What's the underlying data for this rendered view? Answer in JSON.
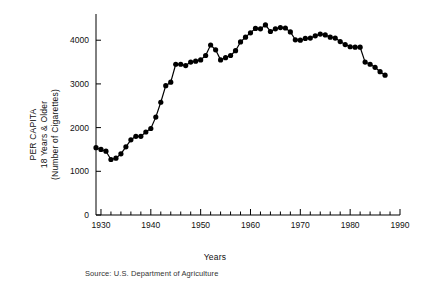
{
  "chart_data": {
    "type": "line",
    "title": "",
    "subtitle": "",
    "xlabel": "Years",
    "ylabel": "PER CAPITA 18 Years & Older (Number of Cigarettes)",
    "ylabel_lines": [
      "PER CAPITA",
      "18 Years & Older",
      "(Number of Cigarettes)"
    ],
    "source_note": "Source: U.S. Department of Agriculture",
    "xlim": [
      1929,
      1990
    ],
    "ylim": [
      0,
      4600
    ],
    "xticks_major": [
      1930,
      1940,
      1950,
      1960,
      1970,
      1980,
      1990
    ],
    "xtick_labels": [
      "1930",
      "1940",
      "1950",
      "1960",
      "1970",
      "1980",
      "1990"
    ],
    "xtick_minor_step": 2,
    "yticks": [
      0,
      1000,
      2000,
      3000,
      4000
    ],
    "ytick_labels": [
      "0",
      "1000",
      "2000",
      "3000",
      "4000"
    ],
    "grid": false,
    "legend": false,
    "legend_position": "none",
    "marker": "filled-circle",
    "line_color": "#000000",
    "marker_color": "#000000",
    "axis_color": "#000000",
    "background_color": "#ffffff",
    "series": [
      {
        "name": "Per capita cigarette consumption",
        "x": [
          1929,
          1930,
          1931,
          1932,
          1933,
          1934,
          1935,
          1936,
          1937,
          1938,
          1939,
          1940,
          1941,
          1942,
          1943,
          1944,
          1945,
          1946,
          1947,
          1948,
          1949,
          1950,
          1951,
          1952,
          1953,
          1954,
          1955,
          1956,
          1957,
          1958,
          1959,
          1960,
          1961,
          1962,
          1963,
          1964,
          1965,
          1966,
          1967,
          1968,
          1969,
          1970,
          1971,
          1972,
          1973,
          1974,
          1975,
          1976,
          1977,
          1978,
          1979,
          1980,
          1981,
          1982,
          1983,
          1984,
          1985,
          1986,
          1987
        ],
        "values": [
          1540,
          1500,
          1460,
          1270,
          1300,
          1400,
          1560,
          1720,
          1800,
          1800,
          1900,
          1980,
          2240,
          2580,
          2960,
          3040,
          3450,
          3450,
          3420,
          3500,
          3520,
          3550,
          3650,
          3890,
          3780,
          3550,
          3600,
          3650,
          3760,
          3960,
          4070,
          4170,
          4270,
          4260,
          4350,
          4200,
          4260,
          4290,
          4280,
          4190,
          4010,
          4000,
          4040,
          4050,
          4100,
          4140,
          4120,
          4070,
          4050,
          3970,
          3900,
          3850,
          3840,
          3840,
          3500,
          3450,
          3380,
          3280,
          3200
        ]
      }
    ]
  }
}
